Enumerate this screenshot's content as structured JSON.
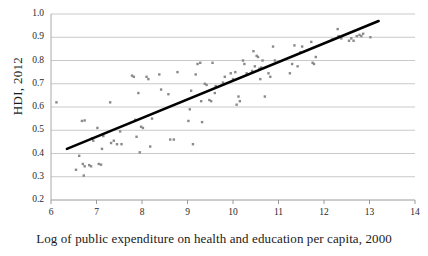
{
  "chart_data": {
    "type": "scatter",
    "title": "",
    "xlabel": "Log of public expenditure on health and education per capita, 2000",
    "ylabel": "HDI, 2012",
    "xlim": [
      6,
      14
    ],
    "ylim": [
      0.2,
      1.0
    ],
    "xticks": [
      "6",
      "7",
      "8",
      "9",
      "10",
      "11",
      "12",
      "13",
      "14"
    ],
    "xtick_values": [
      6,
      7,
      8,
      9,
      10,
      11,
      12,
      13,
      14
    ],
    "yticks": [
      "0.2",
      "0.3",
      "0.4",
      "0.5",
      "0.6",
      "0.7",
      "0.8",
      "0.9",
      "1.0"
    ],
    "ytick_values": [
      0.2,
      0.3,
      0.4,
      0.5,
      0.6,
      0.7,
      0.8,
      0.9,
      1.0
    ],
    "grid": "horizontal",
    "legend": "none",
    "marker_color": "#8a8a8a",
    "trendline_color": "#000000",
    "trendline": {
      "x0": 6.35,
      "y0": 0.42,
      "x1": 13.2,
      "y1": 0.97
    },
    "points": [
      [
        6.12,
        0.62
      ],
      [
        6.55,
        0.33
      ],
      [
        6.62,
        0.39
      ],
      [
        6.7,
        0.355
      ],
      [
        6.72,
        0.305
      ],
      [
        6.74,
        0.345
      ],
      [
        6.68,
        0.54
      ],
      [
        6.74,
        0.542
      ],
      [
        6.84,
        0.35
      ],
      [
        6.88,
        0.345
      ],
      [
        6.9,
        0.465
      ],
      [
        6.93,
        0.455
      ],
      [
        7.02,
        0.51
      ],
      [
        7.05,
        0.355
      ],
      [
        7.1,
        0.352
      ],
      [
        7.12,
        0.42
      ],
      [
        7.15,
        0.475
      ],
      [
        7.3,
        0.62
      ],
      [
        7.32,
        0.445
      ],
      [
        7.38,
        0.455
      ],
      [
        7.45,
        0.44
      ],
      [
        7.52,
        0.495
      ],
      [
        7.55,
        0.44
      ],
      [
        7.78,
        0.735
      ],
      [
        7.82,
        0.73
      ],
      [
        7.85,
        0.545
      ],
      [
        7.88,
        0.472
      ],
      [
        7.92,
        0.66
      ],
      [
        7.95,
        0.405
      ],
      [
        7.98,
        0.515
      ],
      [
        8.02,
        0.51
      ],
      [
        8.1,
        0.73
      ],
      [
        8.14,
        0.72
      ],
      [
        8.18,
        0.43
      ],
      [
        8.22,
        0.55
      ],
      [
        8.38,
        0.74
      ],
      [
        8.42,
        0.675
      ],
      [
        8.58,
        0.655
      ],
      [
        8.62,
        0.46
      ],
      [
        8.7,
        0.46
      ],
      [
        8.78,
        0.75
      ],
      [
        9.02,
        0.54
      ],
      [
        9.05,
        0.59
      ],
      [
        9.08,
        0.67
      ],
      [
        9.12,
        0.44
      ],
      [
        9.18,
        0.74
      ],
      [
        9.22,
        0.785
      ],
      [
        9.28,
        0.79
      ],
      [
        9.3,
        0.625
      ],
      [
        9.32,
        0.535
      ],
      [
        9.38,
        0.7
      ],
      [
        9.42,
        0.695
      ],
      [
        9.48,
        0.63
      ],
      [
        9.52,
        0.625
      ],
      [
        9.55,
        0.79
      ],
      [
        9.6,
        0.66
      ],
      [
        9.62,
        0.69
      ],
      [
        9.78,
        0.705
      ],
      [
        9.82,
        0.73
      ],
      [
        9.95,
        0.745
      ],
      [
        10.0,
        0.72
      ],
      [
        10.05,
        0.75
      ],
      [
        10.08,
        0.61
      ],
      [
        10.12,
        0.645
      ],
      [
        10.15,
        0.625
      ],
      [
        10.22,
        0.8
      ],
      [
        10.25,
        0.785
      ],
      [
        10.3,
        0.745
      ],
      [
        10.42,
        0.755
      ],
      [
        10.45,
        0.84
      ],
      [
        10.48,
        0.775
      ],
      [
        10.52,
        0.82
      ],
      [
        10.55,
        0.815
      ],
      [
        10.58,
        0.765
      ],
      [
        10.6,
        0.72
      ],
      [
        10.62,
        0.77
      ],
      [
        10.65,
        0.8
      ],
      [
        10.7,
        0.645
      ],
      [
        10.78,
        0.745
      ],
      [
        10.82,
        0.73
      ],
      [
        10.88,
        0.86
      ],
      [
        10.92,
        0.8
      ],
      [
        11.25,
        0.745
      ],
      [
        11.3,
        0.785
      ],
      [
        11.35,
        0.865
      ],
      [
        11.42,
        0.775
      ],
      [
        11.48,
        0.835
      ],
      [
        11.52,
        0.86
      ],
      [
        11.72,
        0.88
      ],
      [
        11.75,
        0.79
      ],
      [
        11.78,
        0.785
      ],
      [
        11.82,
        0.815
      ],
      [
        12.18,
        0.89
      ],
      [
        12.3,
        0.935
      ],
      [
        12.32,
        0.905
      ],
      [
        12.38,
        0.895
      ],
      [
        12.55,
        0.885
      ],
      [
        12.6,
        0.895
      ],
      [
        12.65,
        0.885
      ],
      [
        12.72,
        0.905
      ],
      [
        12.78,
        0.91
      ],
      [
        12.82,
        0.905
      ],
      [
        12.86,
        0.915
      ],
      [
        13.02,
        0.9
      ]
    ]
  }
}
